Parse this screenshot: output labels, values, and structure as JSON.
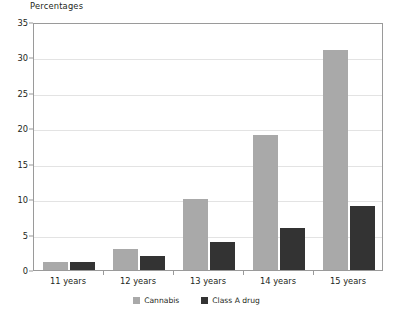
{
  "chart_data": {
    "type": "bar",
    "title": "Percentages",
    "xlabel": "",
    "ylabel": "",
    "ylim": [
      0,
      35
    ],
    "yticks": [
      0,
      5,
      10,
      15,
      20,
      25,
      30,
      35
    ],
    "grid": true,
    "legend_position": "bottom-center",
    "categories": [
      "11 years",
      "12 years",
      "13 years",
      "14 years",
      "15 years"
    ],
    "series": [
      {
        "name": "Cannabis",
        "color": "#a9a9a9",
        "values": [
          1.2,
          3,
          10,
          19,
          31
        ]
      },
      {
        "name": "Class A drug",
        "color": "#333333",
        "values": [
          1.1,
          2,
          4,
          6,
          9
        ]
      }
    ]
  },
  "axis": {
    "y_tick_labels": [
      "0",
      "5",
      "10",
      "15",
      "20",
      "25",
      "30",
      "35"
    ],
    "x_tick_labels": [
      "11 years",
      "12 years",
      "13 years",
      "14 years",
      "15 years"
    ]
  },
  "legend": {
    "items": [
      {
        "label": "Cannabis",
        "swatch": "cannabis-swatch"
      },
      {
        "label": "Class A drug",
        "swatch": "class-a-drug-swatch"
      }
    ]
  },
  "colors": {
    "cannabis": "#a9a9a9",
    "class_a_drug": "#333333",
    "frame": "#9a9a9a",
    "gridline": "#e3e3e3",
    "text": "#231f20"
  }
}
